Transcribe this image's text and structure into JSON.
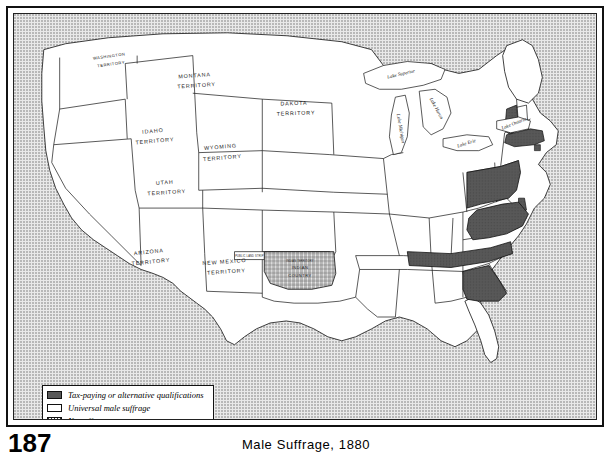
{
  "figure": {
    "page_number": "187",
    "title": "Male Suffrage, 1880"
  },
  "legend": {
    "items": [
      {
        "pattern": "dark",
        "label": "Tax-paying or alternative qualifications"
      },
      {
        "pattern": "white",
        "label": "Universal male suffrage"
      },
      {
        "pattern": "hatch",
        "label": "No suffrage"
      }
    ]
  },
  "colors": {
    "tax_paying_fill": "#585858",
    "universal_fill": "#ffffff",
    "no_suffrage_fill": "#ffffff",
    "outline": "#111111",
    "background_tone": "#e9e9e9"
  },
  "map": {
    "territory_labels": [
      {
        "id": "washington-territory",
        "line1": "WASHINGTON",
        "line2": "TERRITORY"
      },
      {
        "id": "montana-territory",
        "line1": "MONTANA",
        "line2": "TERRITORY"
      },
      {
        "id": "idaho-territory",
        "line1": "IDAHO",
        "line2": "TERRITORY"
      },
      {
        "id": "wyoming-territory",
        "line1": "WYOMING",
        "line2": "TERRITORY"
      },
      {
        "id": "dakota-territory",
        "line1": "DAKOTA",
        "line2": "TERRITORY"
      },
      {
        "id": "utah-territory",
        "line1": "UTAH",
        "line2": "TERRITORY"
      },
      {
        "id": "arizona-territory",
        "line1": "ARIZONA",
        "line2": "TERRITORY"
      },
      {
        "id": "new-mexico-territory",
        "line1": "NEW MEXICO",
        "line2": "TERRITORY"
      },
      {
        "id": "indian-country",
        "line1": "INDIAN",
        "line2": "COUNTRY"
      }
    ],
    "small_labels": [
      {
        "id": "public-land-strip",
        "text": "PUBLIC LAND STRIP"
      },
      {
        "id": "indian-territory-strip",
        "text": "INDIAN TERRITORY"
      }
    ],
    "lake_labels": [
      {
        "id": "lake-superior",
        "text": "Lake Superior"
      },
      {
        "id": "lake-michigan",
        "text": "Lake Michigan"
      },
      {
        "id": "lake-huron",
        "text": "Lake Huron"
      },
      {
        "id": "lake-erie",
        "text": "Lake Erie"
      },
      {
        "id": "lake-ontario",
        "text": "Lake Ontario"
      }
    ],
    "shaded_states": [
      "Vermont",
      "Massachusetts",
      "Rhode Island",
      "Pennsylvania",
      "Delaware",
      "Virginia",
      "Tennessee",
      "Georgia"
    ]
  }
}
